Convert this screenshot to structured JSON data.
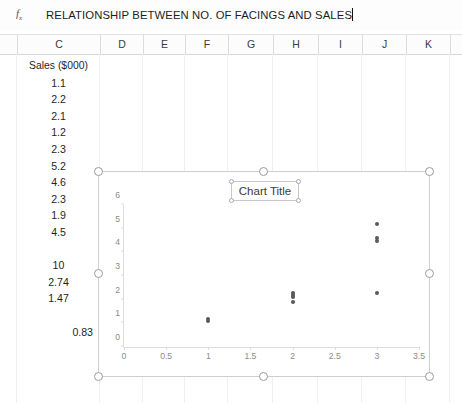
{
  "formula_bar": {
    "fx_label": "fx",
    "value": "RELATIONSHIP BETWEEN NO. OF FACINGS AND SALES"
  },
  "columns": [
    {
      "label": "C",
      "width": 83
    },
    {
      "label": "D",
      "width": 43
    },
    {
      "label": "E",
      "width": 42
    },
    {
      "label": "F",
      "width": 43
    },
    {
      "label": "G",
      "width": 45
    },
    {
      "label": "H",
      "width": 45
    },
    {
      "label": "I",
      "width": 44
    },
    {
      "label": "J",
      "width": 44
    },
    {
      "label": "K",
      "width": 44
    }
  ],
  "sheet": {
    "column_c": [
      {
        "value": "Sales ($000)",
        "align": "center",
        "style": "head"
      },
      {
        "value": "1.1",
        "align": "center",
        "style": "num"
      },
      {
        "value": "2.2",
        "align": "center",
        "style": "num"
      },
      {
        "value": "2.1",
        "align": "center",
        "style": "num"
      },
      {
        "value": "1.2",
        "align": "center",
        "style": "num"
      },
      {
        "value": "2.3",
        "align": "center",
        "style": "num"
      },
      {
        "value": "5.2",
        "align": "center",
        "style": "num"
      },
      {
        "value": "4.6",
        "align": "center",
        "style": "num"
      },
      {
        "value": "2.3",
        "align": "center",
        "style": "num"
      },
      {
        "value": "1.9",
        "align": "center",
        "style": "num"
      },
      {
        "value": "4.5",
        "align": "center",
        "style": "num"
      },
      {
        "value": "",
        "align": "center",
        "style": "blank"
      },
      {
        "value": "10",
        "align": "center",
        "style": "num"
      },
      {
        "value": "2.74",
        "align": "center",
        "style": "num"
      },
      {
        "value": "1.47",
        "align": "center",
        "style": "num"
      },
      {
        "value": "",
        "align": "center",
        "style": "blank"
      },
      {
        "value": "0.83",
        "align": "right",
        "style": "num"
      }
    ]
  },
  "chart": {
    "title": "Chart Title",
    "selected": true
  },
  "chart_data": {
    "type": "scatter",
    "title": "Chart Title",
    "xlabel": "",
    "ylabel": "",
    "xlim": [
      0,
      3.5
    ],
    "ylim": [
      0,
      6
    ],
    "xticks": [
      0,
      0.5,
      1,
      1.5,
      2,
      2.5,
      3,
      3.5
    ],
    "xtick_labels": [
      "0",
      "0.5",
      "1",
      "1.5",
      "2",
      "2.5",
      "3",
      "3.5"
    ],
    "yticks": [
      0,
      1,
      2,
      3,
      4,
      5,
      6
    ],
    "ytick_labels": [
      "0",
      "1",
      "2",
      "3",
      "4",
      "5",
      "6"
    ],
    "grid": false,
    "legend": "none",
    "marker_color": "#595959",
    "series": [
      {
        "name": "Sales ($000)",
        "x": [
          1,
          2,
          2,
          1,
          2,
          3,
          3,
          3,
          2,
          3
        ],
        "y": [
          1.1,
          2.2,
          2.1,
          1.2,
          2.3,
          5.2,
          4.6,
          2.3,
          1.9,
          4.5
        ]
      }
    ]
  }
}
